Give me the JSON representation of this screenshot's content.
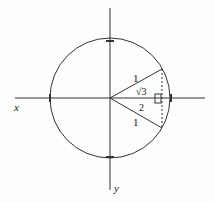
{
  "diagram": {
    "type": "unit circle with inscribed triangle",
    "axes": {
      "horizontal_label": "x",
      "vertical_label": "y"
    },
    "circle": {
      "center": [
        110,
        98
      ],
      "radius": 61,
      "color": "#333333"
    },
    "triangle": {
      "side_upper_label": "1",
      "side_lower_label": "1",
      "height_label_numerator": "√3",
      "height_label_denominator": "2",
      "right_angle_marker": true,
      "vertical_side_style": "dashed"
    },
    "tick_marks": [
      "top",
      "bottom",
      "left",
      "right"
    ]
  }
}
